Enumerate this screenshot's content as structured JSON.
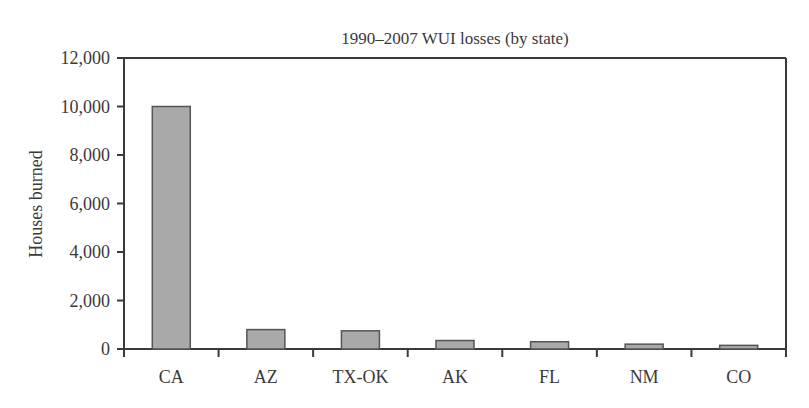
{
  "chart_data": {
    "type": "bar",
    "title": "1990–2007 WUI losses (by state)",
    "xlabel": "",
    "ylabel": "Houses burned",
    "categories": [
      "CA",
      "AZ",
      "TX-OK",
      "AK",
      "FL",
      "NM",
      "CO"
    ],
    "values": [
      10000,
      800,
      750,
      350,
      300,
      200,
      150
    ],
    "ylim": [
      0,
      12000
    ],
    "yticks": [
      0,
      2000,
      4000,
      6000,
      8000,
      10000,
      12000
    ],
    "ytick_labels": [
      "0",
      "2,000",
      "4,000",
      "6,000",
      "8,000",
      "10,000",
      "12,000"
    ],
    "grid": false,
    "legend": null,
    "colors": {
      "bar_fill": "#a9a9a9",
      "bar_stroke": "#555555",
      "axis": "#3a3a3a",
      "text": "#3a3a3a"
    }
  }
}
